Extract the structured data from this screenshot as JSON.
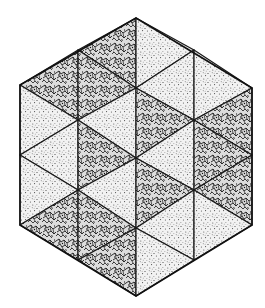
{
  "figure": {
    "background": "#ffffff",
    "stroke_color": "#1a1a1a",
    "textures": {
      "dotted": {
        "base": "#f2f2f2",
        "ink": "#3a3a3a"
      },
      "rocky": {
        "base": "#d8d8d8",
        "ink": "#1c1c1c"
      }
    },
    "hexagon_vertices": [
      [
        136,
        18
      ],
      [
        252,
        88
      ],
      [
        252,
        225
      ],
      [
        136,
        296
      ],
      [
        20,
        225
      ],
      [
        20,
        85
      ]
    ],
    "triangles": [
      {
        "col": 1,
        "pts": [
          [
            20,
            85
          ],
          [
            78,
            50
          ],
          [
            78,
            120
          ]
        ],
        "texture": "rocky"
      },
      {
        "col": 1,
        "pts": [
          [
            20,
            85
          ],
          [
            20,
            155
          ],
          [
            78,
            120
          ]
        ],
        "texture": "dotted"
      },
      {
        "col": 1,
        "pts": [
          [
            20,
            155
          ],
          [
            78,
            120
          ],
          [
            78,
            190
          ]
        ],
        "texture": "dotted"
      },
      {
        "col": 1,
        "pts": [
          [
            20,
            155
          ],
          [
            20,
            225
          ],
          [
            78,
            190
          ]
        ],
        "texture": "dotted"
      },
      {
        "col": 1,
        "pts": [
          [
            20,
            225
          ],
          [
            78,
            190
          ],
          [
            78,
            260
          ]
        ],
        "texture": "rocky"
      },
      {
        "col": 2,
        "pts": [
          [
            78,
            50
          ],
          [
            136,
            18
          ],
          [
            136,
            88
          ]
        ],
        "texture": "rocky"
      },
      {
        "col": 2,
        "pts": [
          [
            78,
            50
          ],
          [
            78,
            120
          ],
          [
            136,
            88
          ]
        ],
        "texture": "rocky"
      },
      {
        "col": 2,
        "pts": [
          [
            78,
            120
          ],
          [
            136,
            88
          ],
          [
            136,
            158
          ]
        ],
        "texture": "dotted"
      },
      {
        "col": 2,
        "pts": [
          [
            78,
            120
          ],
          [
            78,
            190
          ],
          [
            136,
            158
          ]
        ],
        "texture": "rocky"
      },
      {
        "col": 2,
        "pts": [
          [
            78,
            190
          ],
          [
            136,
            158
          ],
          [
            136,
            228
          ]
        ],
        "texture": "dotted"
      },
      {
        "col": 2,
        "pts": [
          [
            78,
            190
          ],
          [
            78,
            260
          ],
          [
            136,
            228
          ]
        ],
        "texture": "rocky"
      },
      {
        "col": 2,
        "pts": [
          [
            78,
            260
          ],
          [
            136,
            228
          ],
          [
            136,
            296
          ]
        ],
        "texture": "rocky"
      },
      {
        "col": 3,
        "pts": [
          [
            136,
            18
          ],
          [
            136,
            88
          ],
          [
            194,
            50
          ]
        ],
        "texture": "dotted"
      },
      {
        "col": 3,
        "pts": [
          [
            136,
            88
          ],
          [
            194,
            50
          ],
          [
            194,
            120
          ]
        ],
        "texture": "dotted"
      },
      {
        "col": 3,
        "pts": [
          [
            136,
            88
          ],
          [
            136,
            158
          ],
          [
            194,
            120
          ]
        ],
        "texture": "rocky"
      },
      {
        "col": 3,
        "pts": [
          [
            136,
            158
          ],
          [
            194,
            120
          ],
          [
            194,
            190
          ]
        ],
        "texture": "dotted"
      },
      {
        "col": 3,
        "pts": [
          [
            136,
            158
          ],
          [
            136,
            228
          ],
          [
            194,
            190
          ]
        ],
        "texture": "rocky"
      },
      {
        "col": 3,
        "pts": [
          [
            136,
            228
          ],
          [
            194,
            190
          ],
          [
            194,
            260
          ]
        ],
        "texture": "dotted"
      },
      {
        "col": 3,
        "pts": [
          [
            136,
            228
          ],
          [
            136,
            296
          ],
          [
            194,
            260
          ]
        ],
        "texture": "dotted"
      },
      {
        "col": 4,
        "pts": [
          [
            194,
            50
          ],
          [
            194,
            120
          ],
          [
            252,
            88
          ]
        ],
        "texture": "dotted"
      },
      {
        "col": 4,
        "pts": [
          [
            194,
            120
          ],
          [
            252,
            88
          ],
          [
            252,
            155
          ]
        ],
        "texture": "rocky"
      },
      {
        "col": 4,
        "pts": [
          [
            194,
            120
          ],
          [
            194,
            190
          ],
          [
            252,
            155
          ]
        ],
        "texture": "rocky"
      },
      {
        "col": 4,
        "pts": [
          [
            194,
            190
          ],
          [
            252,
            155
          ],
          [
            252,
            225
          ]
        ],
        "texture": "rocky"
      },
      {
        "col": 4,
        "pts": [
          [
            194,
            190
          ],
          [
            194,
            260
          ],
          [
            252,
            225
          ]
        ],
        "texture": "dotted"
      }
    ],
    "counts": {
      "total": 24,
      "rocky": 12,
      "dotted": 12
    }
  }
}
